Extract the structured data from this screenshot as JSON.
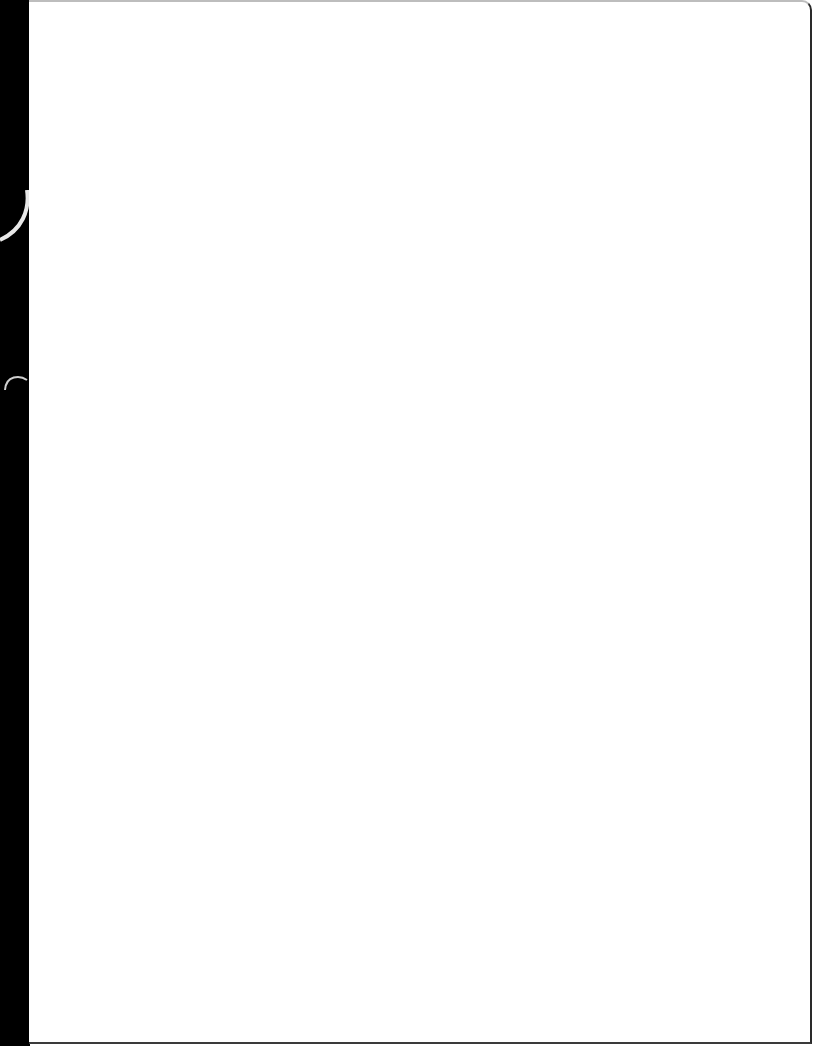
{
  "document": {
    "type": "scanned-blank-page",
    "content": "",
    "colors": {
      "page": "#ffffff",
      "background_edge": "#000000"
    }
  }
}
